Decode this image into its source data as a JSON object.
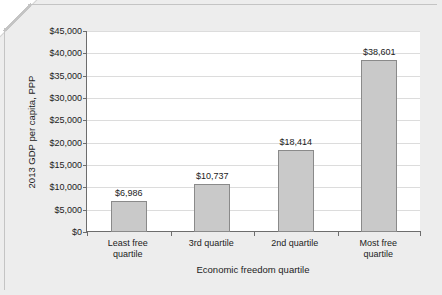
{
  "chart_data": {
    "type": "bar",
    "title": "",
    "categories": [
      "Least free\nquartile",
      "3rd quartile",
      "2nd quartile",
      "Most free\nquartile"
    ],
    "values": [
      6986,
      10737,
      18414,
      38601
    ],
    "data_labels": [
      "$6,986",
      "$10,737",
      "$18,414",
      "$38,601"
    ],
    "xlabel": "Economic freedom quartile",
    "ylabel": "2013 GDP per capita, PPP",
    "ylim": [
      0,
      45000
    ],
    "ytick_values": [
      0,
      5000,
      10000,
      15000,
      20000,
      25000,
      30000,
      35000,
      40000,
      45000
    ],
    "ytick_labels": [
      "$0",
      "$5,000",
      "$10,000",
      "$15,000",
      "$20,000",
      "$25,000",
      "$30,000",
      "$35,000",
      "$40,000",
      "$45,000"
    ],
    "grid": true,
    "legend": "none",
    "bar_color": "#C9C9C9",
    "bar_edge_color": "#8A8A8A",
    "plot_background": "#FFFFFF",
    "canvas_background": "#EDEDED",
    "axis_color": "#6D6D6D",
    "gridline_color": "#DCDCDC",
    "text_color": "#1C1C1C"
  }
}
